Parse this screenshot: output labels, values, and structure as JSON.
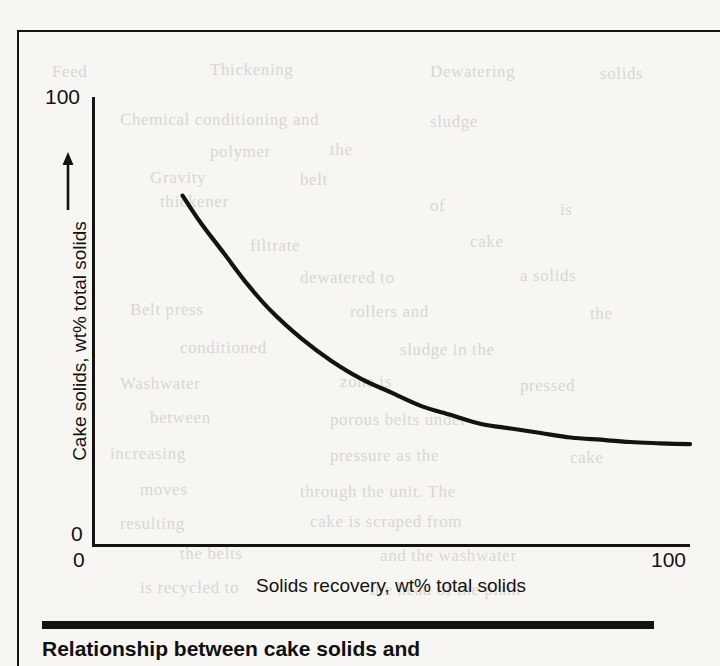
{
  "figure": {
    "caption": "Relationship between cake solids and",
    "background_color": "#f7f6f3",
    "ink_color": "#15130f"
  },
  "axes": {
    "y_tick_top": "100",
    "y_tick_bottom": "0",
    "x_tick_left": "0",
    "x_tick_right": "100",
    "x_title": "Solids recovery, wt% total solids",
    "y_title": "Cake solids, wt% total solids",
    "y_arrow_icon": "up-arrow-icon"
  },
  "bleed_through": [
    {
      "text": "Feed",
      "x": 52,
      "y": 62
    },
    {
      "text": "Thickening",
      "x": 210,
      "y": 60
    },
    {
      "text": "Dewatering",
      "x": 430,
      "y": 62
    },
    {
      "text": "solids",
      "x": 600,
      "y": 64
    },
    {
      "text": "Chemical conditioning and",
      "x": 120,
      "y": 110
    },
    {
      "text": "sludge",
      "x": 430,
      "y": 112
    },
    {
      "text": "polymer",
      "x": 210,
      "y": 142
    },
    {
      "text": "the",
      "x": 330,
      "y": 140
    },
    {
      "text": "Gravity",
      "x": 150,
      "y": 168
    },
    {
      "text": "belt",
      "x": 300,
      "y": 170
    },
    {
      "text": "thickener",
      "x": 160,
      "y": 192
    },
    {
      "text": "of",
      "x": 430,
      "y": 196
    },
    {
      "text": "is",
      "x": 560,
      "y": 200
    },
    {
      "text": "filtrate",
      "x": 250,
      "y": 236
    },
    {
      "text": "cake",
      "x": 470,
      "y": 232
    },
    {
      "text": "dewatered to",
      "x": 300,
      "y": 268
    },
    {
      "text": "a solids",
      "x": 520,
      "y": 266
    },
    {
      "text": "Belt press",
      "x": 130,
      "y": 300
    },
    {
      "text": "rollers and",
      "x": 350,
      "y": 302
    },
    {
      "text": "the",
      "x": 590,
      "y": 304
    },
    {
      "text": "conditioned",
      "x": 180,
      "y": 338
    },
    {
      "text": "sludge in the",
      "x": 400,
      "y": 340
    },
    {
      "text": "Washwater",
      "x": 120,
      "y": 374
    },
    {
      "text": "zone is",
      "x": 340,
      "y": 372
    },
    {
      "text": "pressed",
      "x": 520,
      "y": 376
    },
    {
      "text": "between",
      "x": 150,
      "y": 408
    },
    {
      "text": "porous belts under",
      "x": 330,
      "y": 410
    },
    {
      "text": "increasing",
      "x": 110,
      "y": 444
    },
    {
      "text": "pressure as the",
      "x": 330,
      "y": 446
    },
    {
      "text": "cake",
      "x": 570,
      "y": 448
    },
    {
      "text": "moves",
      "x": 140,
      "y": 480
    },
    {
      "text": "through the unit. The",
      "x": 300,
      "y": 482
    },
    {
      "text": "resulting",
      "x": 120,
      "y": 514
    },
    {
      "text": "cake is scraped from",
      "x": 310,
      "y": 512
    },
    {
      "text": "the belts",
      "x": 180,
      "y": 544
    },
    {
      "text": "and the washwater",
      "x": 380,
      "y": 546
    },
    {
      "text": "is recycled to",
      "x": 140,
      "y": 578
    },
    {
      "text": "the head of the plant",
      "x": 370,
      "y": 580
    }
  ],
  "chart_data": {
    "type": "line",
    "title": "Relationship between cake solids and",
    "xlabel": "Solids recovery, wt% total solids",
    "ylabel": "Cake solids, wt% total solids",
    "xlim": [
      0,
      100
    ],
    "ylim": [
      0,
      100
    ],
    "xticks": [
      0,
      100
    ],
    "yticks": [
      0,
      100
    ],
    "grid": false,
    "legend": "none",
    "series": [
      {
        "name": "cake solids vs solids recovery",
        "x": [
          15,
          18,
          22,
          26,
          30,
          35,
          40,
          45,
          50,
          55,
          60,
          65,
          70,
          75,
          80,
          85,
          90,
          95,
          100
        ],
        "y": [
          78,
          72,
          65,
          58,
          52,
          46,
          41,
          37,
          34,
          31,
          29,
          27,
          26,
          25,
          24,
          23.5,
          23,
          22.7,
          22.5
        ]
      }
    ]
  }
}
